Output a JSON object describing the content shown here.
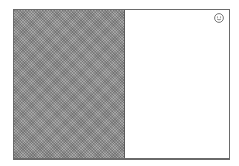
{
  "frame": {
    "border_color": "#6a6a6a"
  },
  "left_panel": {
    "pattern": "dithered-gray",
    "color": "#8e8e8e"
  },
  "right_panel": {
    "color": "#ffffff",
    "icon": "smiley-face-icon"
  }
}
